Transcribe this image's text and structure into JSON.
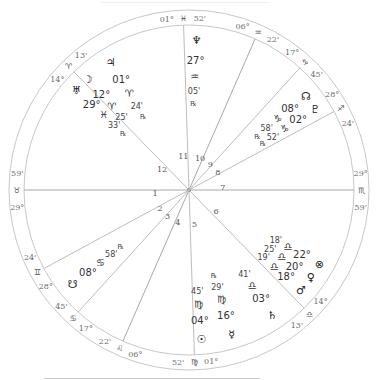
{
  "chart_data": {
    "type": "radial-wheel",
    "title": "",
    "ascendant_longitude": 59.983,
    "cusps": [
      {
        "house": 1,
        "degree": "29°",
        "sign": "♉",
        "minute": "59'",
        "longitude": 59.983
      },
      {
        "house": 2,
        "degree": "28°",
        "sign": "♊",
        "minute": "24'",
        "longitude": 88.4
      },
      {
        "house": 3,
        "degree": "17°",
        "sign": "♋",
        "minute": "45'",
        "longitude": 107.75
      },
      {
        "house": 4,
        "degree": "06°",
        "sign": "♌",
        "minute": "22'",
        "longitude": 126.367
      },
      {
        "house": 5,
        "degree": "01°",
        "sign": "♍",
        "minute": "52'",
        "longitude": 151.867
      },
      {
        "house": 6,
        "degree": "14°",
        "sign": "♎",
        "minute": "13'",
        "longitude": 194.217
      },
      {
        "house": 7,
        "degree": "29°",
        "sign": "♏",
        "minute": "59'",
        "longitude": 239.983
      },
      {
        "house": 8,
        "degree": "28°",
        "sign": "♐",
        "minute": "24'",
        "longitude": 268.4
      },
      {
        "house": 9,
        "degree": "17°",
        "sign": "♑",
        "minute": "45'",
        "longitude": 287.75
      },
      {
        "house": 10,
        "degree": "06°",
        "sign": "♒",
        "minute": "22'",
        "longitude": 306.367
      },
      {
        "house": 11,
        "degree": "01°",
        "sign": "♓",
        "minute": "52'",
        "longitude": 331.867
      },
      {
        "house": 12,
        "degree": "14°",
        "sign": "♈",
        "minute": "13'",
        "longitude": 14.217
      }
    ],
    "planets": [
      {
        "name": "Neptune",
        "glyph": "♆",
        "degree": "27°",
        "sign": "♒",
        "minute": "05'",
        "retrograde": true,
        "longitude": 327.083
      },
      {
        "name": "Uranus",
        "glyph": "♅",
        "degree": "29°",
        "sign": "♓",
        "minute": "33'",
        "retrograde": true,
        "longitude": 359.55
      },
      {
        "name": "Jupiter",
        "glyph": "♃",
        "degree": "01°",
        "sign": "♈",
        "minute": "24'",
        "retrograde": true,
        "longitude": 1.4
      },
      {
        "name": "Moon",
        "glyph": "☽",
        "degree": "12°",
        "sign": "♈",
        "minute": "25'",
        "retrograde": false,
        "longitude": 12.417
      },
      {
        "name": "North Node",
        "glyph": "☊",
        "degree": "08°",
        "sign": "♑",
        "minute": "58'",
        "retrograde": true,
        "longitude": 278.967
      },
      {
        "name": "Pluto",
        "glyph": "♇",
        "degree": "02°",
        "sign": "♑",
        "minute": "52'",
        "retrograde": true,
        "longitude": 272.867
      },
      {
        "name": "Part of Fortune",
        "glyph": "⊗",
        "degree": "22°",
        "sign": "♎",
        "minute": "18'",
        "retrograde": false,
        "longitude": 202.3
      },
      {
        "name": "Venus",
        "glyph": "♀",
        "degree": "20°",
        "sign": "♎",
        "minute": "25'",
        "retrograde": false,
        "longitude": 200.417
      },
      {
        "name": "Mars",
        "glyph": "♂",
        "degree": "18°",
        "sign": "♎",
        "minute": "19'",
        "retrograde": false,
        "longitude": 198.317
      },
      {
        "name": "Saturn",
        "glyph": "♄",
        "degree": "03°",
        "sign": "♎",
        "minute": "41'",
        "retrograde": false,
        "longitude": 183.683
      },
      {
        "name": "Mercury",
        "glyph": "☿",
        "degree": "16°",
        "sign": "♍",
        "minute": "29'",
        "retrograde": true,
        "longitude": 166.483
      },
      {
        "name": "Sun",
        "glyph": "☉",
        "degree": "04°",
        "sign": "♍",
        "minute": "45'",
        "retrograde": false,
        "longitude": 154.75
      },
      {
        "name": "South Node",
        "glyph": "☋",
        "degree": "08°",
        "sign": "♋",
        "minute": "58'",
        "retrograde": true,
        "longitude": 98.967
      }
    ],
    "retrograde_symbol": "℞"
  }
}
